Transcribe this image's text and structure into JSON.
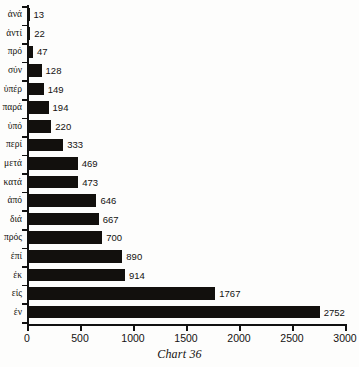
{
  "caption": "Chart 36",
  "chart_data": {
    "type": "bar",
    "orientation": "horizontal",
    "title": "Chart 36",
    "xlabel": "",
    "ylabel": "",
    "xlim": [
      0,
      3000
    ],
    "grid": false,
    "legend": null,
    "bar_color": "#12100d",
    "axis_color": "#111111",
    "background": "#fdfdfc",
    "xticks": [
      0,
      500,
      1000,
      1500,
      2000,
      2500,
      3000
    ],
    "xtick_labels": [
      "0",
      "500",
      "1000",
      "1500",
      "2000",
      "2500",
      "3000"
    ],
    "categories": [
      "ἀνά",
      "ἀντί",
      "πρό",
      "σύν",
      "ὑπέρ",
      "παρά",
      "ὑπό",
      "περί",
      "μετά",
      "κατά",
      "ἀπό",
      "διά",
      "πρός",
      "ἐπί",
      "ἐκ",
      "εἰς",
      "ἐν"
    ],
    "values": [
      13,
      22,
      47,
      128,
      149,
      194,
      220,
      333,
      469,
      473,
      646,
      667,
      700,
      890,
      914,
      1767,
      2752
    ],
    "value_labels": [
      "13",
      "22",
      "47",
      "128",
      "149",
      "194",
      "220",
      "333",
      "469",
      "473",
      "646",
      "667",
      "700",
      "890",
      "914",
      "1767",
      "2752"
    ]
  }
}
